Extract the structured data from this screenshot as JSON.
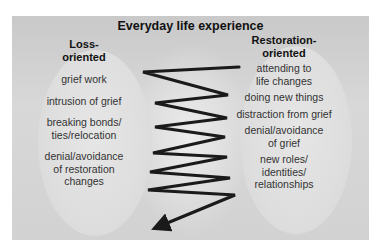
{
  "diagram": {
    "title": "Everyday life experience",
    "loss_oriented": {
      "heading_line1": "Loss-",
      "heading_line2": "oriented",
      "items": [
        {
          "lines": [
            "grief work"
          ]
        },
        {
          "lines": [
            "intrusion of grief"
          ]
        },
        {
          "lines": [
            "breaking bonds/",
            "ties/relocation"
          ]
        },
        {
          "lines": [
            "denial/avoidance",
            "of restoration",
            "changes"
          ]
        }
      ]
    },
    "restoration_oriented": {
      "heading_line1": "Restoration-",
      "heading_line2": "oriented",
      "items": [
        {
          "lines": [
            "attending to",
            "life changes"
          ]
        },
        {
          "lines": [
            "doing new things"
          ]
        },
        {
          "lines": [
            "distraction from grief"
          ]
        },
        {
          "lines": [
            "denial/avoidance",
            "of grief"
          ]
        },
        {
          "lines": [
            "new roles/",
            "identities/",
            "relationships"
          ]
        }
      ]
    },
    "oscillation_arrow": {
      "description": "zigzag arrow oscillating between loss- and restoration-oriented",
      "color": "#1a1a1a",
      "points": [
        [
          239,
          67
        ],
        [
          143,
          72
        ],
        [
          228,
          95
        ],
        [
          155,
          103
        ],
        [
          227,
          118
        ],
        [
          155,
          127
        ],
        [
          225,
          137
        ],
        [
          153,
          153
        ],
        [
          227,
          157
        ],
        [
          150,
          172
        ],
        [
          230,
          178
        ],
        [
          148,
          190
        ],
        [
          235,
          195
        ],
        [
          160,
          226
        ]
      ]
    },
    "colors": {
      "panel": "#d2d2d2",
      "ellipse": "#e2e2e2",
      "text": "#333333",
      "heading": "#111111"
    }
  }
}
